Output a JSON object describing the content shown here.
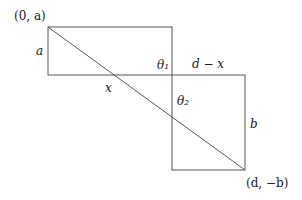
{
  "diagram": {
    "type": "geometry",
    "labels": {
      "top_left_point": "(0, a)",
      "left_side": "a",
      "bottom_segment": "x",
      "theta1": "θ₁",
      "right_segment": "d − x",
      "theta2": "θ₂",
      "right_side": "b",
      "bottom_right_point": "(d, −b)"
    },
    "colors": {
      "line": "#555555",
      "text": "#1a1a1a",
      "background": "#ffffff"
    }
  }
}
